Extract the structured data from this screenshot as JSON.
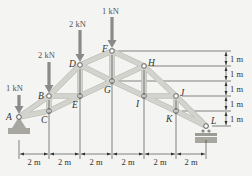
{
  "diagram": {
    "type": "truss",
    "nodes": [
      {
        "id": "A",
        "x": 19,
        "y": 117,
        "lx": 6,
        "ly": 120
      },
      {
        "id": "B",
        "x": 49,
        "y": 96,
        "lx": 38,
        "ly": 99
      },
      {
        "id": "C",
        "x": 49,
        "y": 111,
        "lx": 41,
        "ly": 123
      },
      {
        "id": "D",
        "x": 80,
        "y": 65,
        "lx": 69,
        "ly": 67
      },
      {
        "id": "E",
        "x": 80,
        "y": 96,
        "lx": 72,
        "ly": 108
      },
      {
        "id": "F",
        "x": 112,
        "y": 51,
        "lx": 102,
        "ly": 52
      },
      {
        "id": "G",
        "x": 112,
        "y": 81,
        "lx": 104,
        "ly": 93
      },
      {
        "id": "H",
        "x": 144,
        "y": 66,
        "lx": 148,
        "ly": 66
      },
      {
        "id": "I",
        "x": 144,
        "y": 96,
        "lx": 136,
        "ly": 107
      },
      {
        "id": "J",
        "x": 176,
        "y": 96,
        "lx": 180,
        "ly": 96
      },
      {
        "id": "K",
        "x": 176,
        "y": 111,
        "lx": 166,
        "ly": 122
      },
      {
        "id": "L",
        "x": 206,
        "y": 126,
        "lx": 211,
        "ly": 124
      }
    ],
    "members": [
      [
        "A",
        "B"
      ],
      [
        "B",
        "D"
      ],
      [
        "D",
        "F"
      ],
      [
        "F",
        "H"
      ],
      [
        "H",
        "J"
      ],
      [
        "J",
        "L"
      ],
      [
        "A",
        "C"
      ],
      [
        "C",
        "E"
      ],
      [
        "E",
        "G"
      ],
      [
        "G",
        "I"
      ],
      [
        "I",
        "K"
      ],
      [
        "K",
        "L"
      ],
      [
        "B",
        "C"
      ],
      [
        "D",
        "E"
      ],
      [
        "F",
        "G"
      ],
      [
        "H",
        "I"
      ],
      [
        "J",
        "K"
      ],
      [
        "B",
        "E"
      ],
      [
        "I",
        "J"
      ],
      [
        "D",
        "G"
      ],
      [
        "G",
        "H"
      ]
    ],
    "loads": [
      {
        "node": "A",
        "label": "1 kN",
        "x": 19,
        "top": 95,
        "label_x": 6,
        "label_y": 91
      },
      {
        "node": "B",
        "label": "2 kN",
        "x": 49,
        "top": 62,
        "label_x": 38,
        "label_y": 58
      },
      {
        "node": "D",
        "label": "2 kN",
        "x": 80,
        "top": 30,
        "label_x": 69,
        "label_y": 27
      },
      {
        "node": "F",
        "label": "1 kN",
        "x": 112,
        "top": 17,
        "label_x": 102,
        "label_y": 14
      }
    ],
    "horizontal_dimensions": {
      "labels": [
        "2 m",
        "2 m",
        "2 m",
        "2 m",
        "2 m",
        "2 m"
      ],
      "ticks_x": [
        19,
        49,
        80,
        112,
        144,
        176,
        206
      ],
      "y": 154
    },
    "vertical_dimensions": {
      "labels": [
        "1 m",
        "1 m",
        "1 m",
        "1 m",
        "1 m"
      ],
      "levels_y": [
        51,
        66,
        81,
        96,
        111,
        126
      ],
      "x": 226
    },
    "supports": [
      {
        "node": "A",
        "type": "pin"
      },
      {
        "node": "L",
        "type": "roller"
      }
    ]
  }
}
